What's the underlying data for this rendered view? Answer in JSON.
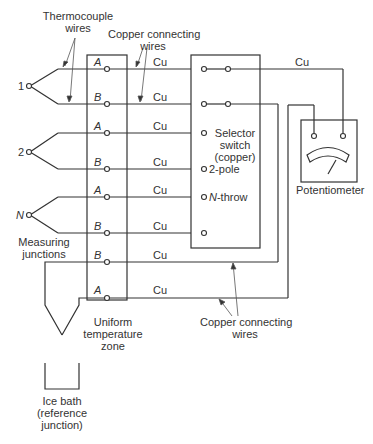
{
  "diagram": {
    "title_labels": {
      "thermocouple_wires": [
        "Thermocouple",
        "wires"
      ],
      "copper_top": [
        "Copper connecting",
        "wires"
      ],
      "copper_bottom": [
        "Copper connecting",
        "wires"
      ],
      "measuring_junctions": [
        "Measuring",
        "junctions"
      ],
      "uniform_zone": [
        "Uniform",
        "temperature",
        "zone"
      ],
      "ice_bath": [
        "Ice bath",
        "(reference",
        "junction)"
      ],
      "selector_switch": [
        "Selector",
        "switch",
        "(copper)"
      ],
      "two_pole": "2-pole",
      "n_throw_prefix": "N",
      "n_throw_suffix": "-throw",
      "potentiometer": "Potentiometer"
    },
    "junctions": [
      "1",
      "2",
      "N"
    ],
    "terminal_rows": [
      {
        "wire": "A",
        "copper": "Cu"
      },
      {
        "wire": "B",
        "copper": "Cu"
      },
      {
        "wire": "A",
        "copper": "Cu"
      },
      {
        "wire": "B",
        "copper": "Cu"
      },
      {
        "wire": "A",
        "copper": "Cu"
      },
      {
        "wire": "B",
        "copper": "Cu"
      },
      {
        "wire": "B",
        "copper": "Cu"
      },
      {
        "wire": "A",
        "copper": "Cu"
      }
    ],
    "top_cu_label": "Cu"
  }
}
